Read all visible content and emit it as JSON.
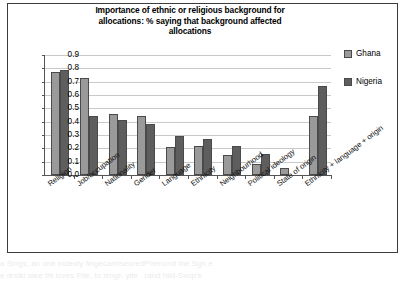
{
  "chart_data": {
    "type": "bar",
    "title": "Importance of ethnic or religious background for allocations: % saying that background affected allocations",
    "xlabel": "",
    "ylabel": "",
    "ylim": [
      0,
      0.9
    ],
    "grid": true,
    "legend_position": "right",
    "ytick_labels": [
      "0.9",
      "0.8",
      "0.7",
      "0.6",
      "0.5",
      "0.4",
      "0.3",
      "0.2",
      "0.1",
      "0.0"
    ],
    "ytick_values": [
      0.9,
      0.8,
      0.7,
      0.6,
      0.5,
      0.4,
      0.3,
      0.2,
      0.1,
      0.0
    ],
    "categories": [
      "Religion",
      "Job/occupation",
      "Nationality",
      "Gender",
      "Language",
      "Ethnicity",
      "Neighbourhood",
      "Political ideology",
      "State of origin",
      "Ethnicity + language + origin"
    ],
    "series": [
      {
        "name": "Ghana",
        "color": "#9a9a9a",
        "values": [
          0.77,
          0.73,
          0.46,
          0.44,
          0.21,
          0.22,
          0.15,
          0.08,
          0.05,
          0.44
        ]
      },
      {
        "name": "Nigeria",
        "color": "#5e5e5e",
        "values": [
          0.79,
          0.44,
          0.41,
          0.38,
          0.29,
          0.27,
          0.22,
          0.16,
          0.0,
          0.67
        ]
      }
    ]
  },
  "title_lines": [
    "Importance of ethnic or religious background for",
    "allocations: % saying that background affected",
    "allocations"
  ],
  "legend": {
    "items": [
      {
        "label": "Ghana"
      },
      {
        "label": "Nigeria"
      }
    ]
  },
  "bleed_text": {
    "line1": "a  Sings,  an  one  indexty  fingecamiseoredPhenond   the  Sgn  e",
    "line2": "e   drsikl alee  thi ioves Fite, to lengt-  yite  . rand   hild-Svop's"
  }
}
